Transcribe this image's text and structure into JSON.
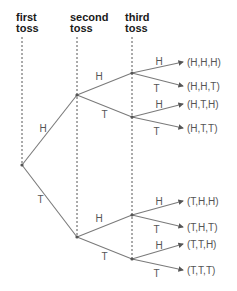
{
  "headers": [
    {
      "id": "first",
      "line1": "first",
      "line2": "toss",
      "x": 16,
      "y": 12
    },
    {
      "id": "second",
      "line1": "second",
      "line2": "toss",
      "x": 70,
      "y": 12
    },
    {
      "id": "third",
      "line1": "third",
      "line2": "toss",
      "x": 125,
      "y": 12
    }
  ],
  "tree": {
    "root": {
      "x": 22,
      "y": 165
    },
    "level1": [
      {
        "label": "H",
        "x": 77,
        "y": 95
      },
      {
        "label": "T",
        "x": 77,
        "y": 237
      }
    ],
    "level2": [
      {
        "label": "H",
        "parent": 0,
        "x": 132,
        "y": 73
      },
      {
        "label": "T",
        "parent": 0,
        "x": 132,
        "y": 117
      },
      {
        "label": "H",
        "parent": 1,
        "x": 132,
        "y": 215
      },
      {
        "label": "T",
        "parent": 1,
        "x": 132,
        "y": 259
      }
    ],
    "leaves": [
      {
        "branch": "H",
        "parent": 0,
        "y": 62,
        "outcome": "(H,H,H)"
      },
      {
        "branch": "T",
        "parent": 0,
        "y": 86,
        "outcome": "(H,H,T)"
      },
      {
        "branch": "H",
        "parent": 1,
        "y": 104,
        "outcome": "(H,T,H)"
      },
      {
        "branch": "T",
        "parent": 1,
        "y": 128,
        "outcome": "(H,T,T)"
      },
      {
        "branch": "H",
        "parent": 2,
        "y": 201,
        "outcome": "(T,H,H)"
      },
      {
        "branch": "T",
        "parent": 2,
        "y": 227,
        "outcome": "(T,H,T)"
      },
      {
        "branch": "H",
        "parent": 3,
        "y": 244,
        "outcome": "(T,T,H)"
      },
      {
        "branch": "T",
        "parent": 3,
        "y": 270,
        "outcome": "(T,T,T)"
      }
    ]
  },
  "colors": {
    "edge": "#7a7a7a",
    "guide": "#444444",
    "text": "#555555",
    "header": "#1a1a1a"
  }
}
